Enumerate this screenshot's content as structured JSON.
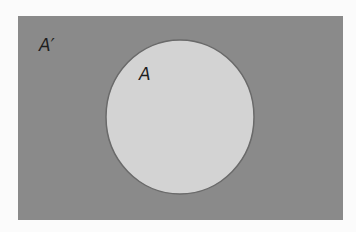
{
  "diagram": {
    "type": "venn",
    "universe": {
      "label": "A′",
      "fill": "#8a8a8a",
      "x": 18,
      "y": 16,
      "width": 325,
      "height": 204
    },
    "set": {
      "label": "A",
      "fill": "#d3d3d3",
      "stroke": "#6a6a6a",
      "cx": 180,
      "cy": 117,
      "rx": 74,
      "ry": 77
    },
    "background": "#fbfbfb"
  }
}
